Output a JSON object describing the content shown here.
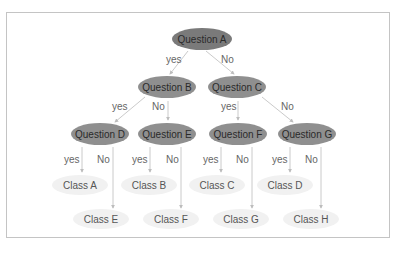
{
  "diagram": {
    "type": "decision-tree",
    "nodes": {
      "qa": "Question A",
      "qb": "Question B",
      "qc": "Question C",
      "qd": "Question D",
      "qe": "Question E",
      "qf": "Question F",
      "qg": "Question G",
      "ca": "Class A",
      "cb": "Class B",
      "cc": "Class C",
      "cd": "Class D",
      "ce": "Class E",
      "cf": "Class F",
      "cg": "Class G",
      "ch": "Class H"
    },
    "edge_labels": {
      "yes": "yes",
      "no": "No"
    },
    "colors": {
      "root": "#7a7a7a",
      "question": "#8f8f8f",
      "leaf": "#f1f1f1",
      "edge": "#bdbdbd"
    }
  }
}
